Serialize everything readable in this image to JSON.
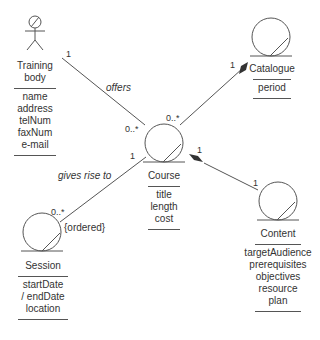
{
  "colors": {
    "stroke": "#555555",
    "text": "#333333",
    "diamond": "#333333"
  },
  "classes": {
    "training_body": {
      "name_line1": "Training",
      "name_line2": "body",
      "stereotype_icon": "actor-icon",
      "attributes": [
        "name",
        "address",
        "telNum",
        "faxNum",
        "e-mail"
      ]
    },
    "course": {
      "name": "Course",
      "stereotype_icon": "entity-icon",
      "attributes": [
        "title",
        "length",
        "cost"
      ]
    },
    "catalogue": {
      "name": "Catalogue",
      "stereotype_icon": "entity-icon",
      "attributes": [
        "period"
      ]
    },
    "session": {
      "name": "Session",
      "stereotype_icon": "entity-icon",
      "attributes": [
        "startDate",
        "/ endDate",
        "location"
      ]
    },
    "content": {
      "name": "Content",
      "stereotype_icon": "entity-icon",
      "attributes": [
        "targetAudience",
        "prerequisites",
        "objectives",
        "resource",
        "plan"
      ]
    }
  },
  "associations": {
    "offers": {
      "label": "offers",
      "from_mult": "1",
      "to_mult": "0..*"
    },
    "catalogue_course": {
      "from_mult": "1",
      "to_mult": "0..*",
      "kind": "aggregation-filled"
    },
    "gives_rise_to": {
      "label": "gives rise to",
      "from_mult": "1",
      "to_mult": "0..*",
      "constraint": "{ordered}"
    },
    "course_content": {
      "from_mult": "1",
      "to_mult": "1",
      "kind": "aggregation-filled"
    }
  }
}
